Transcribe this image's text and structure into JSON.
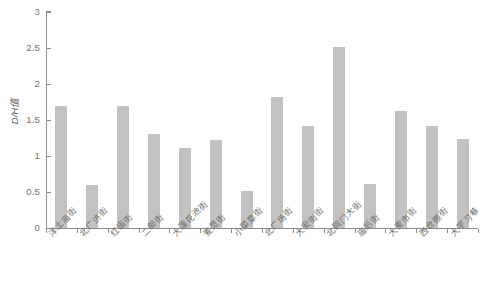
{
  "chart_data": {
    "type": "bar",
    "title": "",
    "xlabel": "",
    "ylabel": "D/H值",
    "ylim": [
      0,
      3
    ],
    "yticks": [
      "0",
      "0.5",
      "1",
      "1.5",
      "2",
      "2.5",
      "3"
    ],
    "grid": false,
    "legend": false,
    "bar_color": "#c2c2c2",
    "axis_color": "#8c8c8c",
    "text_color": "#6b6b6b",
    "categories": [
      "洋土庙街",
      "北广济街",
      "红庙街",
      "二郎街",
      "大莲花池街",
      "麦苋街",
      "小菜菜街",
      "北广场街",
      "大安街街",
      "北院门大街",
      "庙后街",
      "大麦市街",
      "西仓棚街",
      "大学习巷"
    ],
    "values": [
      1.7,
      0.6,
      1.7,
      1.3,
      1.11,
      1.22,
      0.51,
      1.82,
      1.42,
      2.52,
      0.61,
      1.62,
      1.42,
      1.23
    ]
  }
}
